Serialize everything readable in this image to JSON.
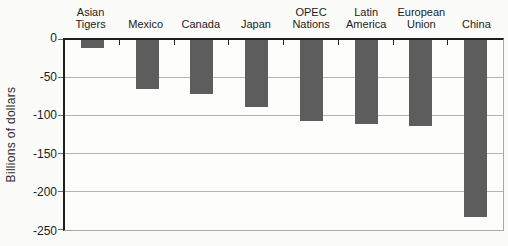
{
  "chart_data": {
    "type": "bar",
    "title": "",
    "xlabel": "",
    "ylabel": "Billions of dollars",
    "categories": [
      "Asian Tigers",
      "Mexico",
      "Canada",
      "Japan",
      "OPEC Nations",
      "Latin America",
      "European Union",
      "China"
    ],
    "values": [
      -10,
      -64,
      -71,
      -88,
      -106,
      -110,
      -113,
      -233
    ],
    "ylim": [
      -250,
      0
    ],
    "yticks": [
      0,
      -50,
      -100,
      -150,
      -200,
      -250
    ],
    "ytick_labels": [
      "0",
      "-50",
      "-100",
      "-150",
      "-200",
      "-250"
    ],
    "grid": true,
    "legend": "none",
    "bar_color": "#5d5d5d",
    "axis_color": "#1f1f1f",
    "gridline_color": "#b3b3b3"
  }
}
